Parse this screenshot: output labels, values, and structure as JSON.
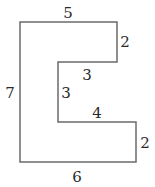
{
  "diagram": {
    "type": "rectilinear-polygon",
    "stroke_color": "#6b6b6b",
    "label_color": "#2a2a2a",
    "vertices": [
      [
        20,
        22
      ],
      [
        117,
        22
      ],
      [
        117,
        62
      ],
      [
        58,
        62
      ],
      [
        58,
        122
      ],
      [
        136,
        122
      ],
      [
        136,
        162
      ],
      [
        20,
        162
      ]
    ],
    "side_labels": [
      {
        "side": "top",
        "value": "5"
      },
      {
        "side": "upper-right",
        "value": "2"
      },
      {
        "side": "upper-inner-horizontal",
        "value": "3"
      },
      {
        "side": "inner-vertical",
        "value": "3"
      },
      {
        "side": "left",
        "value": "7"
      },
      {
        "side": "lower-inner-horizontal",
        "value": "4"
      },
      {
        "side": "lower-right",
        "value": "2"
      },
      {
        "side": "bottom",
        "value": "6"
      }
    ]
  }
}
